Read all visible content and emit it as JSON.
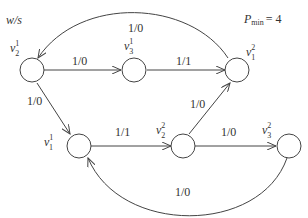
{
  "corner_label": "w/s",
  "pmin": {
    "symbol": "P",
    "subscript": "min",
    "equals": "= 4"
  },
  "nodes": [
    {
      "id": "v2_1",
      "base": "v",
      "sub": "2",
      "sup": "1"
    },
    {
      "id": "v3_1",
      "base": "v",
      "sub": "3",
      "sup": "1"
    },
    {
      "id": "v1_2",
      "base": "v",
      "sub": "1",
      "sup": "2"
    },
    {
      "id": "v1_1",
      "base": "v",
      "sub": "1",
      "sup": "1"
    },
    {
      "id": "v2_2",
      "base": "v",
      "sub": "2",
      "sup": "2"
    },
    {
      "id": "v3_2",
      "base": "v",
      "sub": "3",
      "sup": "2"
    }
  ],
  "edges": [
    {
      "from": "v1_2",
      "to": "v2_1",
      "label": "1/0"
    },
    {
      "from": "v2_1",
      "to": "v3_1",
      "label": "1/0"
    },
    {
      "from": "v3_1",
      "to": "v1_2",
      "label": "1/1"
    },
    {
      "from": "v2_1",
      "to": "v1_1",
      "label": "1/0"
    },
    {
      "from": "v1_1",
      "to": "v2_2",
      "label": "1/1"
    },
    {
      "from": "v2_2",
      "to": "v1_2",
      "label": "1/0"
    },
    {
      "from": "v2_2",
      "to": "v3_2",
      "label": "1/0"
    },
    {
      "from": "v3_2",
      "to": "v1_1",
      "label": "1/0"
    }
  ]
}
